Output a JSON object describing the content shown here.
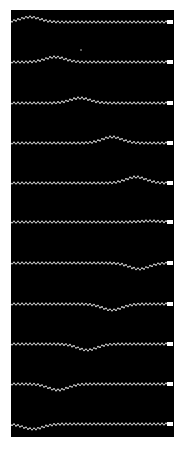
{
  "image": {
    "description": "Black photograph panel showing 11 stacked time-lapse traces of a dotted chain/spring with a pulse traveling to the right end and reflecting back inverted",
    "background_color": "#000000",
    "trace_color": "#e8e8e8",
    "traces": [
      {
        "y": 22,
        "pulse_x": 30,
        "amp": -5
      },
      {
        "y": 62,
        "pulse_x": 55,
        "amp": -5
      },
      {
        "y": 103,
        "pulse_x": 80,
        "amp": -5
      },
      {
        "y": 143,
        "pulse_x": 112,
        "amp": -6
      },
      {
        "y": 183,
        "pulse_x": 136,
        "amp": -6
      },
      {
        "y": 222,
        "pulse_x": 150,
        "amp": -1
      },
      {
        "y": 263,
        "pulse_x": 139,
        "amp": 6
      },
      {
        "y": 304,
        "pulse_x": 112,
        "amp": 6
      },
      {
        "y": 344,
        "pulse_x": 87,
        "amp": 6
      },
      {
        "y": 384,
        "pulse_x": 58,
        "amp": 6
      },
      {
        "y": 424,
        "pulse_x": 33,
        "amp": 5
      }
    ]
  }
}
